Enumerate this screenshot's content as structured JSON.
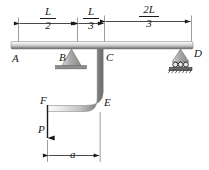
{
  "figure": {
    "type": "engineering-free-body-diagram"
  },
  "dimensions": {
    "seg1": {
      "numerator": "L",
      "denominator": "2"
    },
    "seg2": {
      "numerator": "L",
      "denominator": "3"
    },
    "seg3": {
      "numerator": "2L",
      "denominator": "3"
    },
    "horizontal_offset": "a"
  },
  "points": {
    "a": "A",
    "b": "B",
    "c": "C",
    "d": "D",
    "e": "E",
    "f": "F"
  },
  "loads": {
    "p": "P"
  },
  "supports": {
    "pin": "B",
    "roller": "D",
    "roller_count": 3
  },
  "colors": {
    "line": "#1a1a1a",
    "member_light": "#f2f2f2",
    "member_mid": "#b9b9b9",
    "member_dark": "#6e6e6e",
    "support_fill": "#9a9a9a",
    "hatch": "#2b2b2b"
  }
}
